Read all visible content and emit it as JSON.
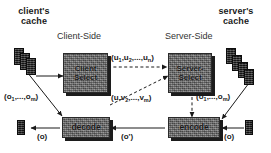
{
  "diagram": {
    "type": "dataflow-diagram",
    "background_color": "#ffffff",
    "box_fill_color": "#6e6e6e",
    "box_shadow_color": "#1c1c1c",
    "object_color": "#232323",
    "text_color": "#1a1a1a"
  },
  "headings": {
    "client_cache": "client's\ncache",
    "server_cache": "server's\ncache",
    "client_side": "Client-Side",
    "server_side": "Server-Side"
  },
  "nodes": {
    "client_select": "Client\nSelect",
    "server_select": "Server-\nSelect",
    "decode": "decode",
    "encode": "encode"
  },
  "edge_labels": {
    "client_cache_objects": "(o",
    "client_cache_objects_sub1": "1",
    "client_cache_objects_mid": ",...,o",
    "client_cache_objects_sub2": "m",
    "client_cache_objects_end": ")",
    "server_cache_objects": "(o",
    "u_vector": "(u",
    "u_vector_sub1": "1",
    "u_vector_mid": ",u",
    "u_vector_sub2": "2",
    "u_vector_mid2": ",...,u",
    "u_vector_sub3": "n",
    "u_vector_end": ")",
    "uv_vector": "(u,v",
    "uv_vector_sub1": "2",
    "uv_vector_mid": ",...,v",
    "uv_vector_sub2": "m",
    "uv_vector_end": ")",
    "object_out_left": "(o)",
    "object_delta": "(o')",
    "object_in_right": "(o)"
  },
  "caches": {
    "client_stack_count": 3,
    "server_stack_count": 4
  }
}
